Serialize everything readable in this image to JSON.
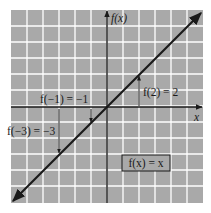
{
  "chart_data": {
    "type": "line",
    "title": "",
    "xlabel": "x",
    "ylabel": "f(x)",
    "xlim": [
      -6,
      6
    ],
    "ylim": [
      -6,
      6
    ],
    "grid": true,
    "legend_position": "none",
    "series": [
      {
        "name": "f(x) = x",
        "x": [
          -6,
          -3,
          -1,
          0,
          2,
          6
        ],
        "y": [
          -6,
          -3,
          -1,
          0,
          2,
          6
        ]
      }
    ],
    "annotations": [
      {
        "text": "f(−1) = −1",
        "x": -1,
        "y": -1
      },
      {
        "text": "f(−3) = −3",
        "x": -3,
        "y": -3
      },
      {
        "text": "f(2) = 2",
        "x": 2,
        "y": 2
      }
    ],
    "function_box": "f(x) = x"
  },
  "labels": {
    "y_axis": "f(x)",
    "x_axis": "x",
    "f_neg1": "f(−1) = −1",
    "f_neg3": "f(−3) = −3",
    "f_2": "f(2) = 2",
    "function_box": "f(x) = x"
  },
  "colors": {
    "plot_background": "#a9a9a9",
    "grid": "#ffffff",
    "axis": "#1a1a1a",
    "line": "#1a1a1a"
  }
}
